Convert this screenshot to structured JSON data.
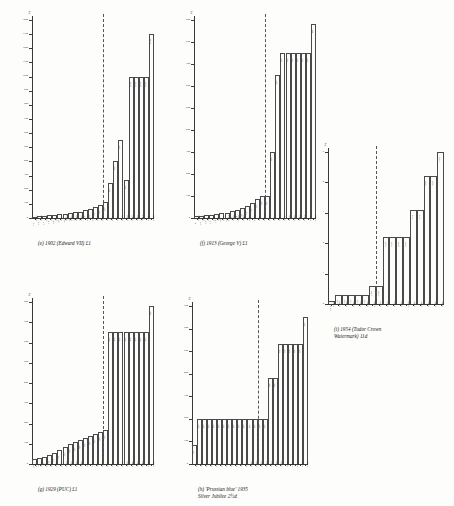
{
  "page": {
    "background_color": "#fdfdfb",
    "ink_color": "#2b2b2b"
  },
  "chart_data": [
    {
      "id": "e",
      "type": "bar",
      "title": "1902 (Edward VII) £1",
      "caption_tag": "(e)",
      "caption_text": "1902 (Edward VII) £1",
      "ylabel": "£",
      "xlabel": "",
      "ylim": [
        0,
        1400
      ],
      "yticks": [
        0,
        100,
        200,
        300,
        400,
        500,
        600,
        700,
        800,
        900,
        1000,
        1100,
        1200,
        1300,
        1400
      ],
      "ytick_labels": [
        "0",
        "100",
        "200",
        "300",
        "400",
        "500",
        "600",
        "700",
        "800",
        "900",
        "1000",
        "1100",
        "1200",
        "1300",
        "1400"
      ],
      "grid": false,
      "legend": "none",
      "reference_line_category": "1970",
      "categories": [
        "1935",
        "1940",
        "1945",
        "1947",
        "1950",
        "1952",
        "1954",
        "1956",
        "1958",
        "1960",
        "1962",
        "1964",
        "1966",
        "1968",
        "1970",
        "1972",
        "1974",
        "1976",
        "1978",
        "1980",
        "1982",
        "1984",
        "1986",
        "1988"
      ],
      "values": [
        10,
        12,
        15,
        18,
        22,
        25,
        30,
        35,
        40,
        45,
        55,
        65,
        75,
        90,
        110,
        250,
        400,
        550,
        270,
        1000,
        1000,
        1000,
        1000,
        1300
      ],
      "value_labels": [
        "10",
        "12",
        "15",
        "18",
        "22",
        "25",
        "30",
        "35",
        "40",
        "45",
        "55",
        "65",
        "75",
        "90",
        "110",
        "250",
        "400",
        "550",
        "270",
        "1000",
        "1000",
        "1000",
        "1000",
        "1300"
      ]
    },
    {
      "id": "f",
      "type": "bar",
      "title": "1913 (George V) £1",
      "caption_tag": "(f)",
      "caption_text": "1913 (George V) £1",
      "ylabel": "£",
      "xlabel": "",
      "ylim": [
        0,
        900
      ],
      "yticks": [
        0,
        100,
        200,
        300,
        400,
        500,
        600,
        700,
        800,
        900
      ],
      "ytick_labels": [
        "0",
        "100",
        "200",
        "300",
        "400",
        "500",
        "600",
        "700",
        "800",
        "900"
      ],
      "grid": false,
      "legend": "none",
      "reference_line_category": "1970",
      "categories": [
        "1935",
        "1940",
        "1945",
        "1947",
        "1950",
        "1952",
        "1954",
        "1956",
        "1958",
        "1960",
        "1962",
        "1964",
        "1966",
        "1968",
        "1970",
        "1972",
        "1974",
        "1976",
        "1978",
        "1980",
        "1982",
        "1984",
        "1986",
        "1988"
      ],
      "values": [
        8,
        10,
        12,
        15,
        18,
        22,
        25,
        30,
        38,
        45,
        55,
        70,
        85,
        100,
        100,
        300,
        650,
        750,
        750,
        750,
        750,
        750,
        750,
        880
      ],
      "value_labels": [
        "8",
        "10",
        "12",
        "15",
        "18",
        "22",
        "25",
        "30",
        "38",
        "45",
        "55",
        "70",
        "85",
        "100",
        "100",
        "300",
        "650",
        "750",
        "750",
        "750",
        "750",
        "750",
        "750",
        "880"
      ]
    },
    {
      "id": "g",
      "type": "bar",
      "title": "1929 (PUC) £1",
      "caption_tag": "(g)",
      "caption_text": "1929 (PUC) £1",
      "ylabel": "£",
      "xlabel": "",
      "ylim": [
        0,
        800
      ],
      "yticks": [
        0,
        100,
        200,
        300,
        400,
        500,
        600,
        700,
        800
      ],
      "ytick_labels": [
        "0",
        "100",
        "200",
        "300",
        "400",
        "500",
        "600",
        "700",
        "800"
      ],
      "grid": false,
      "legend": "none",
      "reference_line_category": "1970",
      "categories": [
        "1935",
        "1940",
        "1945",
        "1947",
        "1950",
        "1952",
        "1954",
        "1956",
        "1958",
        "1960",
        "1962",
        "1964",
        "1966",
        "1968",
        "1970",
        "1972",
        "1974",
        "1976",
        "1978",
        "1980",
        "1982",
        "1984",
        "1986",
        "1988"
      ],
      "values": [
        25,
        30,
        35,
        45,
        55,
        70,
        85,
        100,
        110,
        120,
        130,
        140,
        150,
        160,
        170,
        650,
        650,
        650,
        650,
        650,
        650,
        650,
        650,
        780
      ],
      "value_labels": [
        "25",
        "30",
        "35",
        "45",
        "55",
        "70",
        "85",
        "100",
        "110",
        "120",
        "130",
        "140",
        "150",
        "160",
        "170",
        "650",
        "650",
        "650",
        "650",
        "650",
        "650",
        "650",
        "650",
        "780"
      ]
    },
    {
      "id": "h",
      "type": "bar",
      "title": "'Prussian blue' 1935 Silver Jubilee 2½d",
      "caption_tag": "(h)",
      "caption_text": "'Prussian blue' 1935\nSilver Jubilee 2½d",
      "ylabel": "£",
      "xlabel": "",
      "ylim": [
        0,
        700
      ],
      "yticks": [
        0,
        100,
        200,
        300,
        400,
        500,
        600,
        700
      ],
      "ytick_labels": [
        "0",
        "100",
        "200",
        "300",
        "400",
        "500",
        "600",
        "700"
      ],
      "grid": false,
      "legend": "none",
      "reference_line_category": "1970",
      "categories": [
        "1940",
        "1945",
        "1947",
        "1950",
        "1952",
        "1954",
        "1956",
        "1958",
        "1960",
        "1962",
        "1964",
        "1966",
        "1968",
        "1970",
        "1972",
        "1974",
        "1976",
        "1978",
        "1980",
        "1982",
        "1984",
        "1986",
        "1988"
      ],
      "values": [
        85,
        200,
        200,
        200,
        200,
        200,
        200,
        200,
        200,
        200,
        200,
        200,
        200,
        200,
        200,
        380,
        380,
        530,
        530,
        530,
        530,
        530,
        650
      ],
      "value_labels": [
        "85",
        "200",
        "200",
        "200",
        "200",
        "200",
        "200",
        "200",
        "200",
        "200",
        "200",
        "200",
        "200",
        "200",
        "200",
        "380",
        "380",
        "530",
        "530",
        "530",
        "530",
        "530",
        "650"
      ]
    },
    {
      "id": "i",
      "type": "bar",
      "title": "1954 (Tudor Crown Watermark) 11d",
      "caption_tag": "(i)",
      "caption_text": "1954 (Tudor Crown\nWatermark) 11d",
      "ylabel": "£",
      "xlabel": "",
      "ylim": [
        0,
        5
      ],
      "yticks": [
        0,
        1,
        2,
        3,
        4,
        5
      ],
      "ytick_labels": [
        "0",
        "1",
        "2",
        "3",
        "4",
        "5"
      ],
      "grid": false,
      "legend": "none",
      "reference_line_category": "1970",
      "categories": [
        "1956",
        "1958",
        "1960",
        "1962",
        "1964",
        "1966",
        "1968",
        "1970",
        "1972",
        "1974",
        "1976",
        "1978",
        "1980",
        "1982",
        "1984",
        "1986",
        "1988"
      ],
      "values": [
        0.1,
        0.3,
        0.3,
        0.3,
        0.3,
        0.3,
        0.6,
        0.6,
        2.2,
        2.2,
        2.2,
        2.2,
        3.1,
        3.1,
        4.2,
        4.2,
        5.0
      ],
      "value_labels": [
        "0.10",
        "0.30",
        "0.30",
        "0.30",
        "0.30",
        "0.30",
        "0.60",
        "0.60",
        "2.20",
        "2.20",
        "2.20",
        "2.20",
        "3.10",
        "3.10",
        "4.20",
        "4.20",
        "5.00"
      ]
    }
  ],
  "layout": {
    "panels": [
      {
        "id": "e",
        "left": 10,
        "top": 8,
        "width": 150,
        "height": 240,
        "plot_left": 22,
        "plot_top": 12,
        "plot_width": 122,
        "plot_height": 198
      },
      {
        "id": "f",
        "left": 172,
        "top": 8,
        "width": 150,
        "height": 240,
        "plot_left": 22,
        "plot_top": 12,
        "plot_width": 122,
        "plot_height": 198
      },
      {
        "id": "i",
        "left": 306,
        "top": 142,
        "width": 148,
        "height": 198,
        "plot_left": 22,
        "plot_top": 10,
        "plot_width": 116,
        "plot_height": 152
      },
      {
        "id": "g",
        "left": 10,
        "top": 292,
        "width": 150,
        "height": 210,
        "plot_left": 22,
        "plot_top": 10,
        "plot_width": 122,
        "plot_height": 162
      },
      {
        "id": "h",
        "left": 170,
        "top": 296,
        "width": 150,
        "height": 206,
        "plot_left": 22,
        "plot_top": 10,
        "plot_width": 116,
        "plot_height": 158
      }
    ]
  }
}
